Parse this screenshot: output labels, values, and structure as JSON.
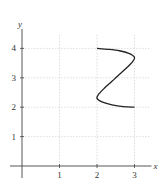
{
  "chart_data": {
    "type": "line",
    "title": "",
    "xlabel": "x",
    "ylabel": "y",
    "xlim": [
      -0.2,
      3.4
    ],
    "ylim": [
      -0.3,
      4.8
    ],
    "grid": true,
    "x_ticks": [
      1,
      2,
      3
    ],
    "y_ticks": [
      1,
      2,
      3,
      4
    ],
    "x_tick_labels": [
      "1",
      "2",
      "3"
    ],
    "y_tick_labels": [
      "1",
      "2",
      "3",
      "4"
    ],
    "series": [
      {
        "name": "curve",
        "note": "approximate parametric curve read off the image",
        "points": [
          [
            2.0,
            4.0
          ],
          [
            2.3,
            3.97
          ],
          [
            2.6,
            3.92
          ],
          [
            2.85,
            3.83
          ],
          [
            3.0,
            3.7
          ],
          [
            2.95,
            3.55
          ],
          [
            2.8,
            3.35
          ],
          [
            2.6,
            3.12
          ],
          [
            2.5,
            3.0
          ],
          [
            2.4,
            2.88
          ],
          [
            2.2,
            2.65
          ],
          [
            2.05,
            2.45
          ],
          [
            2.0,
            2.3
          ],
          [
            2.15,
            2.17
          ],
          [
            2.4,
            2.08
          ],
          [
            2.7,
            2.02
          ],
          [
            3.0,
            2.0
          ]
        ]
      }
    ]
  }
}
